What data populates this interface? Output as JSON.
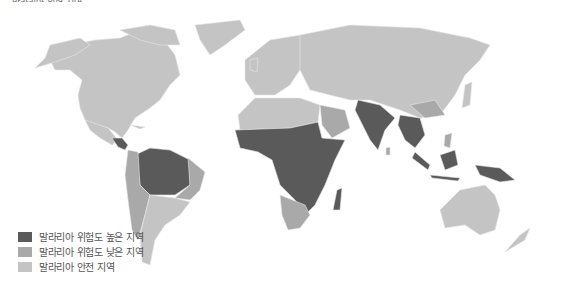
{
  "map": {
    "title": "말라리아 위험 지역",
    "colors": {
      "high_risk": "#5a5a5a",
      "low_risk": "#a9a9a9",
      "safe": "#c4c4c4",
      "ocean": "#ffffff",
      "border": "#e6e6e6"
    },
    "legend": [
      {
        "label": "말라리아 위험도 높은 지역",
        "color": "#5a5a5a"
      },
      {
        "label": "말라리아 위험도 낮은 지역",
        "color": "#a9a9a9"
      },
      {
        "label": "말라리아 안전 지역",
        "color": "#c4c4c4"
      }
    ],
    "regions": {
      "high_risk": [
        "Central America",
        "Amazon basin",
        "Sub-Saharan Africa",
        "Madagascar",
        "India",
        "Southeast Asia",
        "Indonesia",
        "Papua New Guinea"
      ],
      "low_risk": [
        "Andean South America",
        "Southern Africa",
        "Southern China",
        "Arabian coast"
      ],
      "safe": [
        "North America",
        "Greenland",
        "Europe",
        "Russia",
        "China",
        "Australia",
        "New Zealand",
        "Southern South America",
        "North Africa"
      ]
    }
  }
}
